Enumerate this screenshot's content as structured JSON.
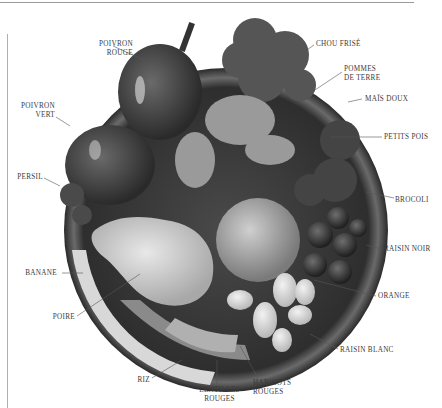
{
  "diagram": {
    "labels": [
      {
        "id": "poivron_rouge",
        "text": "POIVRON\nROUGE",
        "x": 78,
        "y": 40,
        "align": "r",
        "w": 55,
        "lx1": 113,
        "ly1": 46,
        "lx2": 144,
        "ly2": 60
      },
      {
        "id": "chou_frise",
        "text": "CHOU FRISÉ",
        "x": 316,
        "y": 40,
        "align": "l",
        "w": 60,
        "lx1": 314,
        "ly1": 45,
        "lx2": 298,
        "ly2": 56
      },
      {
        "id": "pommes_de_terre",
        "text": "POMMES\nDE TERRE",
        "x": 344,
        "y": 65,
        "align": "l",
        "w": 50,
        "lx1": 342,
        "ly1": 72,
        "lx2": 300,
        "ly2": 100
      },
      {
        "id": "mais_doux",
        "text": "MAÏS DOUX",
        "x": 365,
        "y": 95,
        "align": "l",
        "w": 60,
        "lx1": 362,
        "ly1": 99,
        "lx2": 348,
        "ly2": 102
      },
      {
        "id": "poivron_vert",
        "text": "POIVRON\nVERT",
        "x": 0,
        "y": 102,
        "align": "r",
        "w": 55,
        "lx1": 56,
        "ly1": 117,
        "lx2": 70,
        "ly2": 126
      },
      {
        "id": "petits_pois",
        "text": "PETITS POIS",
        "x": 384,
        "y": 133,
        "align": "l",
        "w": 60,
        "lx1": 382,
        "ly1": 137,
        "lx2": 330,
        "ly2": 137
      },
      {
        "id": "persil",
        "text": "PERSIL",
        "x": 0,
        "y": 173,
        "align": "r",
        "w": 43,
        "lx1": 44,
        "ly1": 178,
        "lx2": 60,
        "ly2": 186
      },
      {
        "id": "brocoli",
        "text": "BROCOLI",
        "x": 395,
        "y": 196,
        "align": "l",
        "w": 45,
        "lx1": 394,
        "ly1": 198,
        "lx2": 366,
        "ly2": 192
      },
      {
        "id": "raisin_noir",
        "text": "RAISIN NOIR",
        "x": 384,
        "y": 245,
        "align": "l",
        "w": 58,
        "lx1": 382,
        "ly1": 249,
        "lx2": 366,
        "ly2": 245
      },
      {
        "id": "banane",
        "text": "BANANE",
        "x": 0,
        "y": 269,
        "align": "r",
        "w": 57,
        "lx1": 62,
        "ly1": 273,
        "lx2": 83,
        "ly2": 273
      },
      {
        "id": "orange",
        "text": "ORANGE",
        "x": 378,
        "y": 292,
        "align": "l",
        "w": 45,
        "lx1": 376,
        "ly1": 296,
        "lx2": 314,
        "ly2": 280
      },
      {
        "id": "poire",
        "text": "POIRE",
        "x": 0,
        "y": 313,
        "align": "r",
        "w": 75,
        "lx1": 77,
        "ly1": 316,
        "lx2": 140,
        "ly2": 274
      },
      {
        "id": "raisin_blanc",
        "text": "RAISIN BLANC",
        "x": 340,
        "y": 346,
        "align": "l",
        "w": 65,
        "lx1": 338,
        "ly1": 349,
        "lx2": 310,
        "ly2": 334
      },
      {
        "id": "riz",
        "text": "RIZ",
        "x": 120,
        "y": 376,
        "align": "r",
        "w": 30,
        "lx1": 152,
        "ly1": 378,
        "lx2": 182,
        "ly2": 360
      },
      {
        "id": "haricots_rouges",
        "text": "HARICOTS\nROUGES",
        "x": 253,
        "y": 379,
        "align": "l",
        "w": 50,
        "lx1": 258,
        "ly1": 378,
        "lx2": 240,
        "ly2": 346
      },
      {
        "id": "lentilles_rouges",
        "text": "LENTILLES\nROUGES",
        "x": 192,
        "y": 386,
        "align": "c",
        "w": 55,
        "lx1": 217,
        "ly1": 386,
        "lx2": 217,
        "ly2": 360
      }
    ]
  },
  "colors": {
    "plate_rim": "#3a3a3a",
    "plate_inner": "#5a5a5a",
    "leader": "#555555",
    "label": "#3a3a3a"
  }
}
